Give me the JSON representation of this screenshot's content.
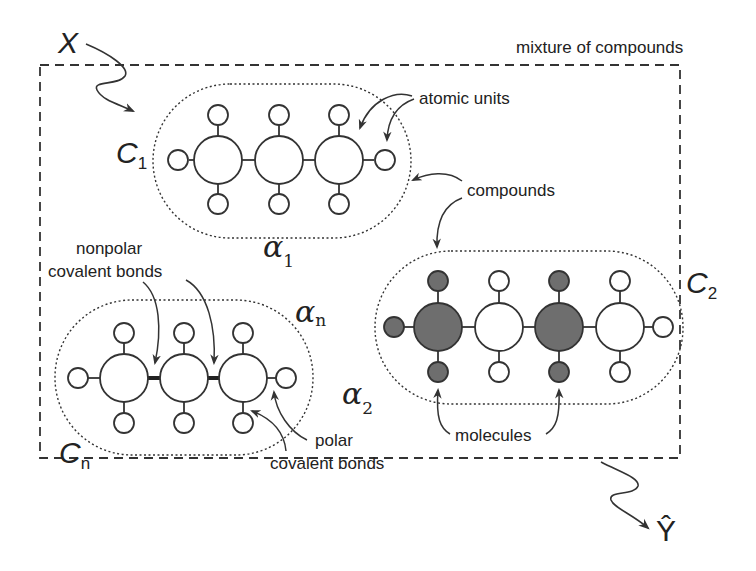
{
  "diagram": {
    "title_label": "mixture of compounds",
    "input_symbol": "X",
    "output_symbol": "Ŷ",
    "colors": {
      "stroke": "#333333",
      "shaded_atom": "#6e6e6e",
      "open_atom": "#ffffff",
      "background": "#ffffff"
    },
    "annotations": {
      "atomic_units": "atomic units",
      "compounds": "compounds",
      "nonpolar_line1": "nonpolar",
      "nonpolar_line2": "covalent bonds",
      "polar_line1": "polar",
      "polar_line2": "covalent bonds",
      "molecules": "molecules"
    },
    "compounds": [
      {
        "id": "C1",
        "label": "C",
        "label_sub": "1",
        "weight": "α",
        "weight_sub": "1",
        "atoms": [
          "open",
          "open",
          "open"
        ],
        "bond_style": "thin"
      },
      {
        "id": "C2",
        "label": "C",
        "label_sub": "2",
        "weight": "α",
        "weight_sub": "2",
        "atoms": [
          "shaded",
          "open",
          "shaded",
          "open"
        ],
        "bond_style": "thin"
      },
      {
        "id": "Cn",
        "label": "C",
        "label_sub": "n",
        "weight": "α",
        "weight_sub": "n",
        "atoms": [
          "open",
          "open",
          "open"
        ],
        "bond_style": "thick"
      }
    ]
  }
}
